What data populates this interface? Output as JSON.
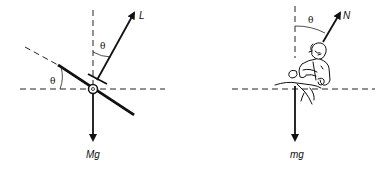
{
  "diagrams": [
    {
      "name": "airplane-banked-turn",
      "labels": {
        "lift": "L",
        "weight": "Mg",
        "angle_bank": "θ",
        "angle_vertical": "θ"
      }
    },
    {
      "name": "cyclist-leaning-turn",
      "labels": {
        "normal": "N",
        "weight": "mg",
        "angle_vertical": "θ"
      }
    }
  ]
}
